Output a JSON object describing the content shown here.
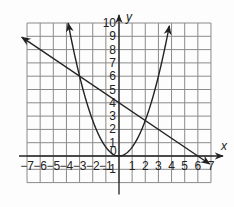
{
  "chart_data": {
    "type": "line",
    "title": "",
    "xlabel": "x",
    "ylabel": "y",
    "xlim": [
      -7,
      7
    ],
    "ylim": [
      -2,
      10
    ],
    "grid": true,
    "x_ticks": [
      -7,
      -6,
      -5,
      -4,
      -3,
      -2,
      -1,
      0,
      1,
      2,
      3,
      4,
      5,
      6,
      7
    ],
    "x_tick_labels": [
      "-7",
      "-6",
      "-5",
      "-4",
      "-3",
      "-2",
      "-1",
      "0",
      "1",
      "2",
      "3",
      "4",
      "5",
      "6",
      "7"
    ],
    "y_ticks": [
      -1,
      1,
      2,
      3,
      4,
      5,
      6,
      7,
      8,
      9,
      10
    ],
    "y_tick_labels": [
      "-1",
      "1",
      "2",
      "3",
      "4",
      "5",
      "6",
      "7",
      "8",
      "9",
      "10"
    ],
    "series": [
      {
        "name": "parabola",
        "equation": "y = (2/3)x^2",
        "a": 0.6667,
        "h": 0,
        "k": 0,
        "x_range": [
          -3.87,
          3.87
        ],
        "arrows": "both"
      },
      {
        "name": "line",
        "equation": "y = -(2/3)x + 4",
        "slope": -0.6667,
        "intercept": 4,
        "x_range": [
          -7,
          7
        ],
        "arrows": "both"
      }
    ],
    "intersections": [
      [
        -3,
        6
      ],
      [
        2,
        2.67
      ]
    ]
  },
  "colors": {
    "grid": "#8a8a8a",
    "axis": "#222222",
    "curve": "#222222",
    "background": "#fdfdfd"
  }
}
